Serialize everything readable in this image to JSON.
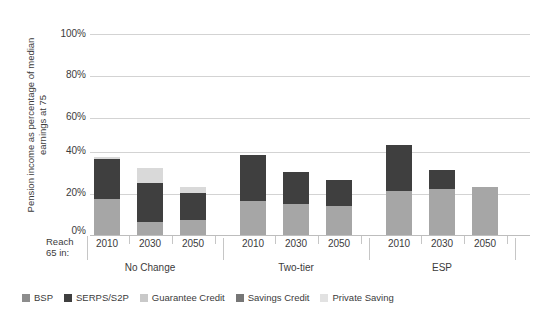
{
  "chart_data": {
    "type": "bar",
    "subtype": "stacked",
    "title": "",
    "xlabel": "",
    "ylabel": "Pension income as percentage of median earnings at 75",
    "ylim": [
      0,
      100
    ],
    "ytick_labels": [
      "0%",
      "20%",
      "40%",
      "60%",
      "80%",
      "100%"
    ],
    "ytick_values": [
      0,
      20,
      40,
      60,
      80,
      100
    ],
    "grid": true,
    "legend_position": "bottom",
    "row_header": "Reach 65 in:",
    "groups": [
      "No Change",
      "Two-tier",
      "ESP"
    ],
    "categories": [
      "2010",
      "2030",
      "2050",
      "2010",
      "2030",
      "2050",
      "2010",
      "2030",
      "2050"
    ],
    "series": [
      {
        "name": "BSP",
        "color": "#8d8d8d",
        "values": [
          0,
          0,
          0,
          0,
          0,
          0,
          0,
          0,
          0
        ]
      },
      {
        "name": "SERPS/S2P",
        "color": "#3f3f3f",
        "values": [
          19,
          19,
          13,
          22,
          15,
          12,
          22,
          9,
          0
        ]
      },
      {
        "name": "Guarantee Credit",
        "color": "#a6a6a6",
        "values": [
          17,
          6,
          7,
          16,
          15,
          14,
          21,
          22,
          23
        ]
      },
      {
        "name": "Savings Credit",
        "color": "#767676",
        "values": [
          0,
          0,
          0,
          0,
          0,
          0,
          0,
          0,
          0
        ]
      },
      {
        "name": "Private Saving",
        "color": "#d9d9d9",
        "values": [
          1,
          7,
          3,
          0,
          0,
          0,
          0,
          0,
          0
        ]
      }
    ],
    "stack_order": [
      "Guarantee Credit",
      "SERPS/S2P",
      "Private Saving",
      "Savings Credit",
      "BSP"
    ],
    "bar_totals": [
      37,
      32,
      23,
      38,
      30,
      26,
      43,
      31,
      23
    ],
    "extra_bands": [
      {
        "bar_index": 2,
        "after": "SERPS/S2P",
        "series": "Private Saving",
        "value": 3
      }
    ]
  },
  "legend": {
    "items": [
      {
        "label": "BSP",
        "color": "#8d8d8d"
      },
      {
        "label": "SERPS/S2P",
        "color": "#3f3f3f"
      },
      {
        "label": "Guarantee Credit",
        "color": "#c9c9c9"
      },
      {
        "label": "Savings Credit",
        "color": "#767676"
      },
      {
        "label": "Private Saving",
        "color": "#e2e2e2"
      }
    ]
  },
  "axis": {
    "y_title": "Pension income as percentage of median earnings at 75",
    "reach_label_line1": "Reach",
    "reach_label_line2": "65 in:",
    "y_labels": [
      "100%",
      "80%",
      "60%",
      "40%",
      "20%",
      "0%"
    ],
    "x_categories": [
      "2010",
      "2030",
      "2050",
      "2010",
      "2030",
      "2050",
      "2010",
      "2030",
      "2050"
    ],
    "groups": [
      "No Change",
      "Two-tier",
      "ESP"
    ]
  }
}
